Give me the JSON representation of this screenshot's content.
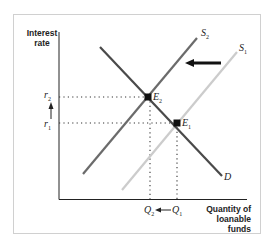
{
  "diagram": {
    "y_axis_label": [
      "Interest",
      "rate"
    ],
    "x_axis_label": [
      "Quantity of",
      "loanable funds"
    ],
    "curves": [
      {
        "id": "S2",
        "label": "S",
        "sub": "2",
        "color": "#6b6b6b",
        "from": [
          83,
          174
        ],
        "to": [
          197,
          38
        ]
      },
      {
        "id": "S1",
        "label": "S",
        "sub": "1",
        "color": "#c9c9c9",
        "from": [
          122,
          190
        ],
        "to": [
          237,
          52
        ]
      },
      {
        "id": "D",
        "label": "D",
        "sub": "",
        "color": "#4a4a4a",
        "from": [
          100,
          47
        ],
        "to": [
          222,
          176
        ]
      }
    ],
    "points": [
      {
        "id": "E2",
        "label": "E",
        "sub": "2",
        "x": 148,
        "y": 97
      },
      {
        "id": "E1",
        "label": "E",
        "sub": "1",
        "x": 177,
        "y": 123
      }
    ],
    "y_ticks": [
      {
        "label": "r",
        "sub": "2",
        "y": 97
      },
      {
        "label": "r",
        "sub": "1",
        "y": 123
      }
    ],
    "x_ticks": [
      {
        "label": "Q",
        "sub": "2",
        "x": 150
      },
      {
        "label": "Q",
        "sub": "1",
        "x": 177
      }
    ],
    "shift_arrow": {
      "from": [
        221,
        63
      ],
      "to": [
        186,
        63
      ],
      "meaning": "supply shifts left"
    },
    "rate_arrow": {
      "direction": "up",
      "meaning": "interest rate rises r1 to r2"
    },
    "quantity_arrow": {
      "direction": "left",
      "meaning": "quantity falls Q1 to Q2"
    }
  }
}
